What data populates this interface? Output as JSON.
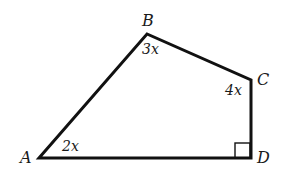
{
  "figure": {
    "type": "quadrilateral",
    "stroke_color": "#111111",
    "background": "#ffffff",
    "vertices": [
      {
        "name": "A",
        "x": 39,
        "y": 158
      },
      {
        "name": "B",
        "x": 147,
        "y": 34
      },
      {
        "name": "C",
        "x": 251,
        "y": 80
      },
      {
        "name": "D",
        "x": 251,
        "y": 158
      }
    ],
    "labels": {
      "A": "A",
      "B": "B",
      "C": "C",
      "D": "D"
    },
    "angles": {
      "A": "2x",
      "B": "3x",
      "C": "4x",
      "D": "right-angle"
    }
  }
}
